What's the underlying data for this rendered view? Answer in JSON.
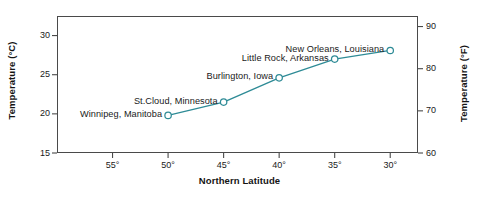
{
  "chart_data": {
    "type": "line",
    "title": "",
    "xlabel": "Northern Latitude",
    "ylabel": "Temperature (°C)",
    "ylabel_secondary": "Temperature (°F)",
    "xlim": [
      60,
      27.5
    ],
    "ylim": [
      15,
      32.5
    ],
    "ylim_secondary": [
      60,
      92.5
    ],
    "x_inverted": true,
    "grid": false,
    "legend": "none",
    "line_color": "#2e8b96",
    "marker": "open-circle",
    "xticks": [
      "55°",
      "50°",
      "45°",
      "40°",
      "35°",
      "30°"
    ],
    "xtick_values": [
      55,
      50,
      45,
      40,
      35,
      30
    ],
    "yticks_left": [
      "30",
      "25",
      "20",
      "15"
    ],
    "ytick_values_left": [
      30,
      25,
      20,
      15
    ],
    "yticks_right": [
      "90",
      "80",
      "70",
      "60"
    ],
    "ytick_values_right": [
      90,
      80,
      70,
      60
    ],
    "x": [
      50,
      45,
      40,
      35,
      30
    ],
    "values": [
      19.8,
      21.5,
      24.6,
      27.0,
      28.1
    ],
    "points": [
      {
        "label": "Winnipeg, Manitoba",
        "latitude": 50,
        "celsius": 19.8,
        "fahrenheit": 67.6,
        "label_side": "left"
      },
      {
        "label": "St.Cloud, Minnesota",
        "latitude": 45,
        "celsius": 21.5,
        "fahrenheit": 70.7,
        "label_side": "left"
      },
      {
        "label": "Burlington, Iowa",
        "latitude": 40,
        "celsius": 24.6,
        "fahrenheit": 76.3,
        "label_side": "left"
      },
      {
        "label": "Little Rock, Arkansas",
        "latitude": 35,
        "celsius": 27.0,
        "fahrenheit": 80.6,
        "label_side": "left"
      },
      {
        "label": "New Orleans, Louisiana",
        "latitude": 30,
        "celsius": 28.1,
        "fahrenheit": 82.6,
        "label_side": "left"
      }
    ]
  },
  "axes": {
    "x_title": "Northern Latitude",
    "y_title_left": "Temperature (°C)",
    "y_title_right": "Temperature (°F)",
    "xtick_labels": [
      "55°",
      "50°",
      "45°",
      "40°",
      "35°",
      "30°"
    ],
    "ytick_labels_left": [
      "30",
      "25",
      "20",
      "15"
    ],
    "ytick_labels_right": [
      "90",
      "80",
      "70",
      "60"
    ]
  },
  "annotations": {
    "p0": "Winnipeg, Manitoba",
    "p1": "St.Cloud, Minnesota",
    "p2": "Burlington, Iowa",
    "p3": "Little Rock, Arkansas",
    "p4": "New Orleans, Louisiana"
  },
  "colors": {
    "line": "#2e8b96",
    "marker_stroke": "#2e8b96",
    "marker_fill": "#ffffff",
    "frame": "#4a4a4a",
    "text": "#1a1a1a",
    "background": "#ffffff"
  }
}
